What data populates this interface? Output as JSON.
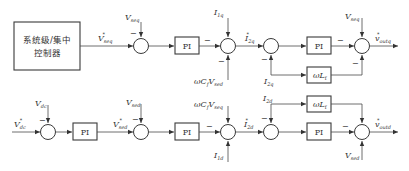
{
  "diagram": {
    "controller_block": {
      "line1": "系统级/集中",
      "line2": "控制器"
    },
    "blocks": {
      "pi": "PI",
      "wLf": "ωL",
      "wLf_sub": "f"
    },
    "row_q": {
      "ref_in": {
        "main": "V",
        "sub": "seq",
        "sup": "*"
      },
      "fb1": {
        "main": "V",
        "sub": "seq"
      },
      "dist1_top": {
        "main": "I",
        "sub": "1q"
      },
      "dist1_bottom": {
        "main": "ωC",
        "sub1": "f",
        "main2": "V",
        "sub2": "sed"
      },
      "i_ref": {
        "main": "I",
        "sub": "2q",
        "sup": "*"
      },
      "fb2": {
        "main": "I",
        "sub": "2q"
      },
      "ff_top": {
        "main": "V",
        "sub": "seq"
      },
      "out": {
        "main": "v",
        "sub": "outq",
        "sup": "*"
      }
    },
    "row_d": {
      "ref_in": {
        "main": "V",
        "sub": "dc",
        "sup": "*"
      },
      "fb0": {
        "main": "V",
        "sub": "dc"
      },
      "ref2": {
        "main": "V",
        "sub": "sed",
        "sup": "*"
      },
      "fb1": {
        "main": "V",
        "sub": "sed"
      },
      "dist1_top": {
        "main": "ωC",
        "sub1": "f",
        "main2": "V",
        "sub2": "seq"
      },
      "dist1_bottom": {
        "main": "I",
        "sub": "1d"
      },
      "i_ref": {
        "main": "I",
        "sub": "2d",
        "sup": "*"
      },
      "fb2": {
        "main": "I",
        "sub": "2d"
      },
      "ff_bottom": {
        "main": "V",
        "sub": "sed"
      },
      "out": {
        "main": "v",
        "sub": "outd",
        "sup": "*"
      }
    },
    "signs": {
      "minus": "−"
    }
  }
}
